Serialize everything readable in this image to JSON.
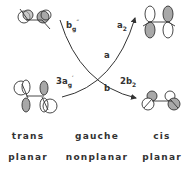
{
  "diagram": {
    "transitions": [
      {
        "from_label": "b_g''",
        "to_label": "2b_2",
        "path_label": "b"
      },
      {
        "from_label": "3a_g'",
        "to_label": "a_2",
        "path_label": "a"
      }
    ],
    "symbols": {
      "bg": {
        "main": "b",
        "sub": "g",
        "sup": "″"
      },
      "a2": {
        "main": "a",
        "sub": "2"
      },
      "a": "a",
      "b": "b",
      "ag3": {
        "main": "3a",
        "sub": "g",
        "sup": "′"
      },
      "b2": {
        "main": "2b",
        "sub": "2"
      }
    },
    "columns": [
      {
        "conformation": "trans",
        "geometry": "planar"
      },
      {
        "conformation": "gauche",
        "geometry": "nonplanar"
      },
      {
        "conformation": "cis",
        "geometry": "planar"
      }
    ],
    "colors": {
      "line": "#333333",
      "shade": "#a8a8a8",
      "background": "#ffffff"
    }
  }
}
